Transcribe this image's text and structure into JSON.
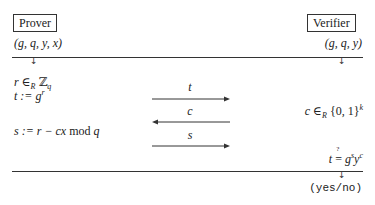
{
  "prover": {
    "label": "Prover",
    "inputs": "(g, q, y, x)",
    "step1_var": "r",
    "step1_rel": " ∈",
    "step1_sub": "R",
    "step1_set": " ℤ",
    "step1_setsub": "q",
    "step2_lhs": "t := g",
    "step2_sup": "r",
    "step3": "s := r − cx ",
    "step3_mod": "mod",
    "step3_q": " q"
  },
  "verifier": {
    "label": "Verifier",
    "inputs": "(g, q, y)",
    "challenge_lhs": "c ∈",
    "challenge_sub": "R",
    "challenge_set": " {0, 1}",
    "challenge_sup": "k",
    "check_lhs": "t ",
    "check_rel": "=",
    "check_q": "?",
    "check_g": " g",
    "check_sup_s": "s",
    "check_y": "y",
    "check_sup_c": "c",
    "output": "(yes/no)"
  },
  "messages": [
    {
      "label": "t",
      "direction": "right"
    },
    {
      "label": "c",
      "direction": "left"
    },
    {
      "label": "s",
      "direction": "right"
    }
  ],
  "colors": {
    "line": "#333333",
    "text": "#222222",
    "background": "#ffffff"
  }
}
